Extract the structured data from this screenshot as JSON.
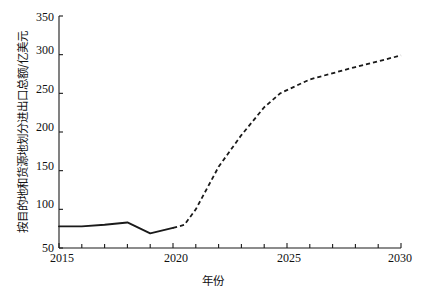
{
  "chart_data": {
    "type": "line",
    "title": "",
    "xlabel": "年份",
    "ylabel": "按目的地和货源地划分进出口总额/亿美元",
    "xlim": [
      2015,
      2030
    ],
    "ylim": [
      50,
      350
    ],
    "xticks": [
      "2015",
      "2020",
      "2025",
      "2030"
    ],
    "xtick_values": [
      2015,
      2020,
      2025,
      2030
    ],
    "yticks": [
      "50",
      "100",
      "150",
      "200",
      "250",
      "300",
      "350"
    ],
    "ytick_values": [
      50,
      100,
      150,
      200,
      250,
      300,
      350
    ],
    "x_minor_tick_interval": 1,
    "grid": false,
    "legend": null,
    "series": [
      {
        "name": "历史值",
        "linestyle": "solid",
        "color": "#1a1a1a",
        "x": [
          2015,
          2016,
          2017,
          2018,
          2019,
          2020
        ],
        "values": [
          78,
          78,
          80,
          83,
          69,
          76
        ]
      },
      {
        "name": "预测值",
        "linestyle": "dashed",
        "color": "#1a1a1a",
        "x": [
          2020,
          2020.5,
          2021,
          2022,
          2023,
          2024,
          2024.7,
          2026,
          2028,
          2030
        ],
        "values": [
          76,
          80,
          100,
          155,
          196,
          232,
          250,
          268,
          284,
          299
        ]
      }
    ]
  },
  "axes": {
    "y_axis_name": "y-axis",
    "x_axis_name": "x-axis"
  }
}
